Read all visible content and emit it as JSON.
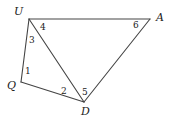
{
  "diagram": {
    "type": "quadrilateral-with-diagonal",
    "vertices": [
      {
        "id": "U",
        "label": "U",
        "x": 29,
        "y": 19,
        "lx": 14,
        "ly": 15
      },
      {
        "id": "A",
        "label": "A",
        "x": 150,
        "y": 19,
        "lx": 156,
        "ly": 21
      },
      {
        "id": "Q",
        "label": "Q",
        "x": 21,
        "y": 82,
        "lx": 7,
        "ly": 89
      },
      {
        "id": "D",
        "label": "D",
        "x": 84,
        "y": 102,
        "lx": 81,
        "ly": 115
      }
    ],
    "edges": [
      {
        "from": "U",
        "to": "A"
      },
      {
        "from": "A",
        "to": "D"
      },
      {
        "from": "D",
        "to": "Q"
      },
      {
        "from": "Q",
        "to": "U"
      },
      {
        "from": "U",
        "to": "D"
      }
    ],
    "angles": [
      {
        "label": "1",
        "at": "Q",
        "x": 25,
        "y": 74
      },
      {
        "label": "2",
        "at": "D",
        "x": 61,
        "y": 94
      },
      {
        "label": "3",
        "at": "U",
        "x": 29,
        "y": 43
      },
      {
        "label": "4",
        "at": "U",
        "x": 40,
        "y": 30
      },
      {
        "label": "5",
        "at": "D",
        "x": 82,
        "y": 95
      },
      {
        "label": "6",
        "at": "A",
        "x": 133,
        "y": 28
      }
    ]
  }
}
